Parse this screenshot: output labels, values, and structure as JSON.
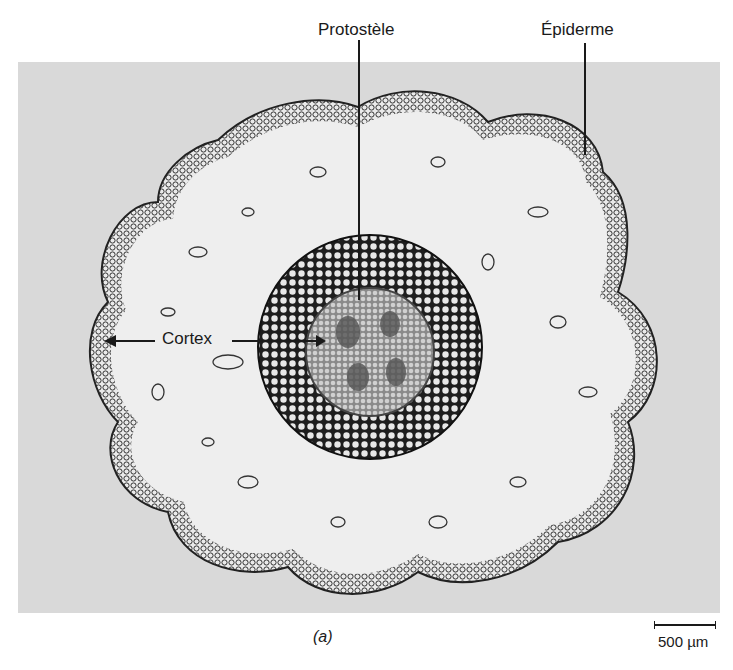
{
  "figure": {
    "caption": "(a)",
    "labels": {
      "protostele": "Protostèle",
      "epidermis": "Épiderme",
      "cortex": "Cortex"
    },
    "scale_bar": {
      "label": "500 µm"
    }
  },
  "colors": {
    "background": "#d9d9d9",
    "tissue_dark": "#1e1e1e",
    "tissue_light": "#eeeeee",
    "stele": "#b8b8b8"
  }
}
